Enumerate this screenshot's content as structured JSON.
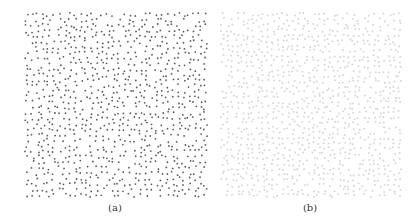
{
  "figure": {
    "panels": [
      {
        "id": "a",
        "caption": "(a)",
        "description": "Blue-noise point distribution, dark dots",
        "dot_color": "#5a5a5a",
        "dot_radius": 0.9,
        "width": 184,
        "height": 186,
        "grid_cols": 34,
        "grid_rows": 34,
        "seed": 17
      },
      {
        "id": "b",
        "caption": "(b)",
        "description": "Blue-noise point distribution, light dots",
        "dot_color": "#d6d6d6",
        "dot_radius": 1.0,
        "width": 182,
        "height": 186,
        "grid_cols": 36,
        "grid_rows": 36,
        "seed": 91
      }
    ]
  }
}
